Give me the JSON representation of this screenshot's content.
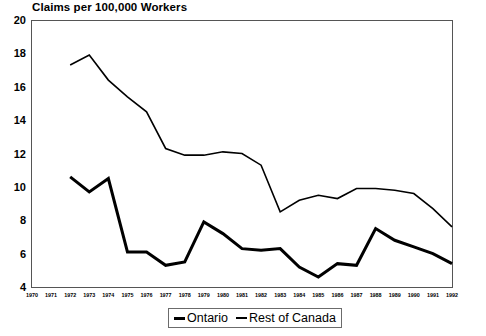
{
  "chart_data": {
    "type": "line",
    "title": "Claims per 100,000 Workers",
    "xlabel": "",
    "ylabel": "",
    "grid": false,
    "legend_position": "bottom",
    "xlim": [
      1970,
      1992
    ],
    "ylim": [
      4,
      20
    ],
    "yticks": [
      4,
      6,
      8,
      10,
      12,
      14,
      16,
      18,
      20
    ],
    "xticks": [
      1970,
      1971,
      1972,
      1973,
      1974,
      1975,
      1976,
      1977,
      1978,
      1979,
      1980,
      1981,
      1982,
      1983,
      1984,
      1985,
      1986,
      1987,
      1988,
      1989,
      1990,
      1991,
      1992
    ],
    "x": [
      1972,
      1973,
      1974,
      1975,
      1976,
      1977,
      1978,
      1979,
      1980,
      1981,
      1982,
      1983,
      1984,
      1985,
      1986,
      1987,
      1988,
      1989,
      1990,
      1991,
      1992
    ],
    "series": [
      {
        "name": "Ontario",
        "color": "#000000",
        "line_width": 3,
        "values": [
          10.6,
          9.7,
          10.5,
          6.1,
          6.1,
          5.3,
          5.5,
          7.9,
          7.2,
          6.3,
          6.2,
          6.3,
          5.2,
          4.6,
          5.4,
          5.3,
          7.5,
          6.8,
          6.4,
          6.0,
          5.4
        ]
      },
      {
        "name": "Rest of Canada",
        "color": "#000000",
        "line_width": 1.6,
        "values": [
          17.3,
          17.9,
          16.4,
          15.4,
          14.5,
          12.3,
          11.9,
          11.9,
          12.1,
          12.0,
          11.3,
          8.5,
          9.2,
          9.5,
          9.3,
          9.9,
          9.9,
          9.8,
          9.6,
          8.7,
          7.6
        ]
      }
    ]
  },
  "legend": {
    "items": [
      {
        "label": "Ontario"
      },
      {
        "label": "Rest of Canada"
      }
    ]
  },
  "axis": {
    "y_labels": [
      "20",
      "18",
      "16",
      "14",
      "12",
      "10",
      "8",
      "6",
      "4"
    ],
    "x_labels": [
      "1970",
      "1971",
      "1972",
      "1973",
      "1974",
      "1975",
      "1976",
      "1977",
      "1978",
      "1979",
      "1980",
      "1981",
      "1982",
      "1983",
      "1984",
      "1985",
      "1986",
      "1987",
      "1988",
      "1989",
      "1990",
      "1991",
      "1992"
    ]
  }
}
